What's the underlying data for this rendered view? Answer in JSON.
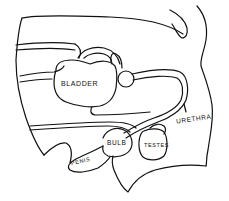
{
  "diagram": {
    "type": "anatomical-line-drawing",
    "stroke_color": "#111111",
    "background": "#ffffff",
    "labels": {
      "bladder": "BLADDER",
      "urethra": "URETHRA",
      "bulb": "BULB",
      "testes": "TESTES",
      "penis": "PENIS"
    }
  }
}
